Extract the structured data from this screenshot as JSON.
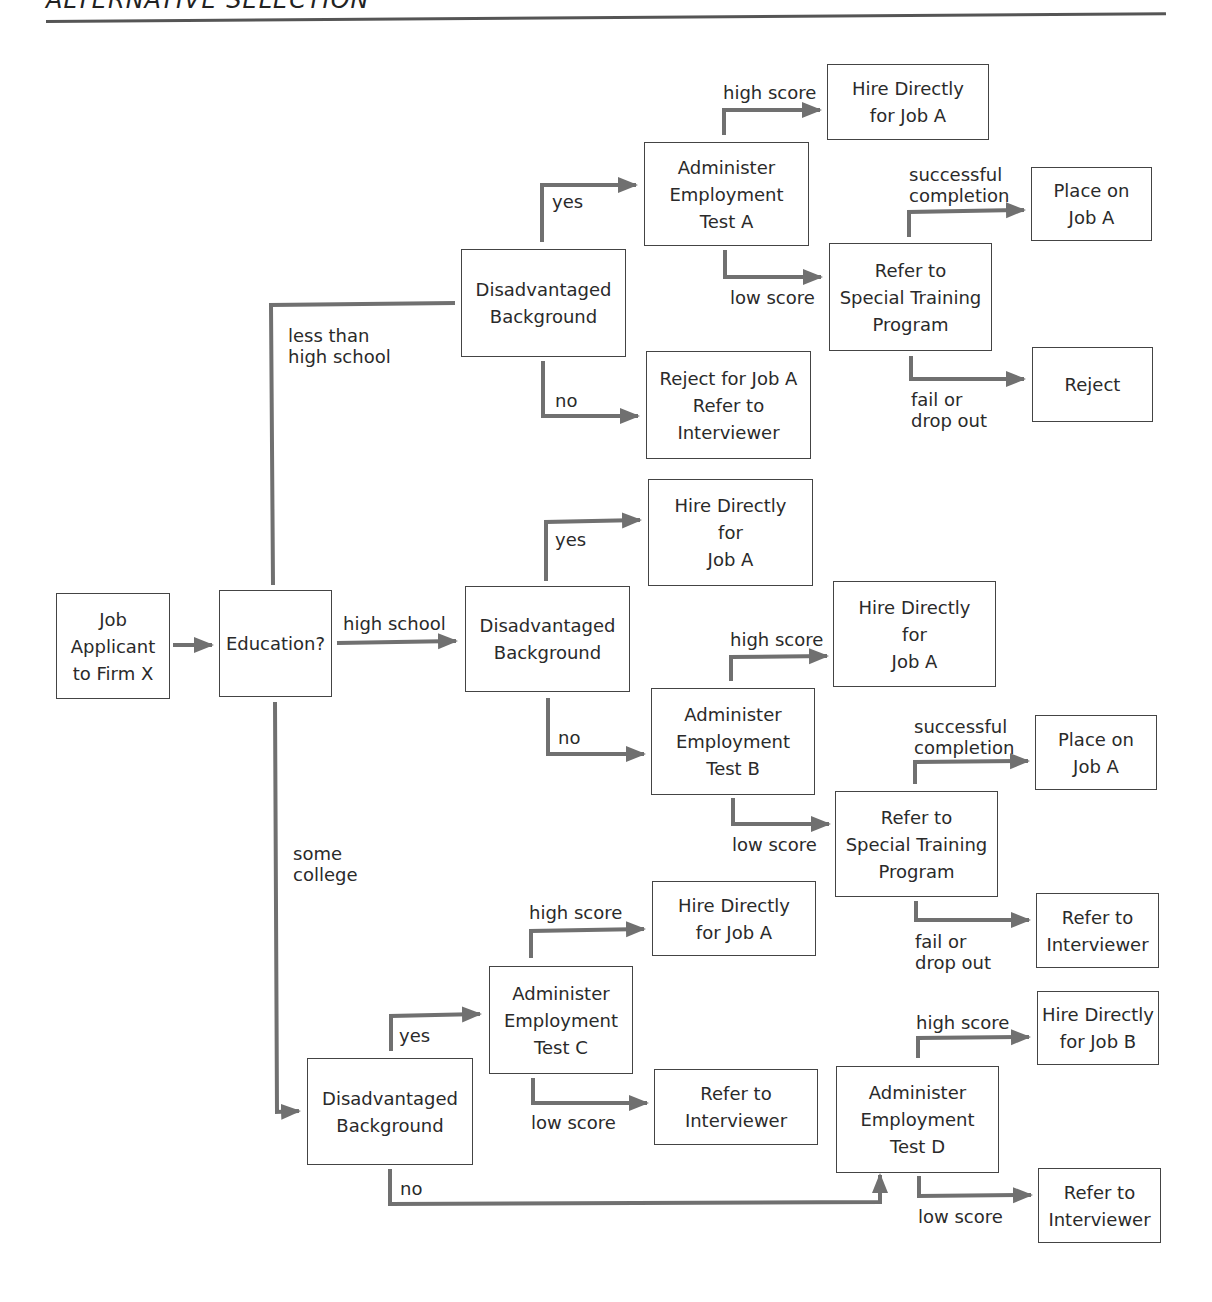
{
  "header": {
    "title": "ALTERNATIVE SELECTION"
  },
  "nodes": {
    "applicant": "Job\nApplicant\nto Firm X",
    "education": "Education?",
    "disadv_lths": "Disadvantaged\nBackground",
    "test_a": "Administer\nEmployment\nTest A",
    "hire_a_top": "Hire Directly\nfor Job A",
    "place_a_top": "Place on\nJob A",
    "training_top": "Refer to\nSpecial Training\nProgram",
    "reject": "Reject",
    "reject_refer": "Reject for Job A\nRefer to\nInterviewer",
    "hire_a_hs_yes": "Hire Directly\nfor\nJob A",
    "disadv_hs": "Disadvantaged\nBackground",
    "hire_a_test_b": "Hire Directly\nfor\nJob A",
    "test_b": "Administer\nEmployment\nTest B",
    "place_a_mid": "Place on\nJob A",
    "training_mid": "Refer to\nSpecial Training\nProgram",
    "refer_interviewer_mid": "Refer to\nInterviewer",
    "hire_a_test_c": "Hire Directly\nfor Job A",
    "test_c": "Administer\nEmployment\nTest C",
    "refer_interviewer_c": "Refer to\nInterviewer",
    "disadv_college": "Disadvantaged\nBackground",
    "test_d": "Administer\nEmployment\nTest D",
    "hire_b": "Hire Directly\nfor Job B",
    "refer_interviewer_d": "Refer to\nInterviewer"
  },
  "labels": {
    "less_than_hs": "less than\nhigh school",
    "high_school": "high school",
    "some_college": "some\ncollege",
    "lths_yes": "yes",
    "lths_no": "no",
    "test_a_high": "high score",
    "test_a_low": "low score",
    "training_top_success": "successful\ncompletion",
    "training_top_fail": "fail or\ndrop out",
    "hs_yes": "yes",
    "hs_no": "no",
    "test_b_high": "high score",
    "test_b_low": "low score",
    "training_mid_success": "successful\ncompletion",
    "training_mid_fail": "fail or\ndrop out",
    "college_yes": "yes",
    "college_no": "no",
    "test_c_high": "high score",
    "test_c_low": "low score",
    "test_d_high": "high score",
    "test_d_low": "low score"
  },
  "colors": {
    "connector": "#707070",
    "border": "#444444",
    "text": "#2a2a2a"
  }
}
